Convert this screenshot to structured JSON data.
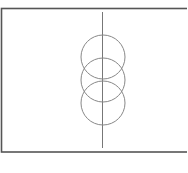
{
  "diagram": {
    "frame": {
      "x": 1.5,
      "y": 8.5,
      "width": 200,
      "height": 143.5,
      "stroke": "#555555",
      "stroke_width": 1.6
    },
    "axis_line": {
      "x": 102.5,
      "y1": 12,
      "y2": 148,
      "stroke": "#777777",
      "stroke_width": 1
    },
    "circles": [
      {
        "cx": 103,
        "cy": 57,
        "r": 22,
        "stroke": "#888888"
      },
      {
        "cx": 103,
        "cy": 80,
        "r": 22,
        "stroke": "#888888"
      },
      {
        "cx": 103,
        "cy": 103,
        "r": 22,
        "stroke": "#888888"
      }
    ],
    "background": "#ffffff"
  }
}
